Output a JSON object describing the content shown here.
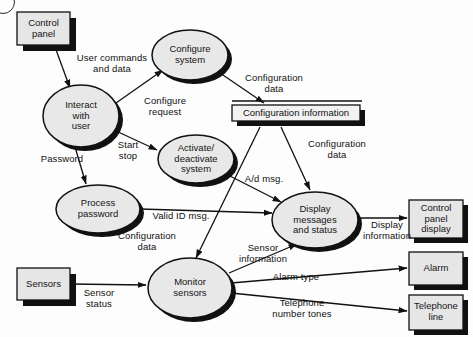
{
  "diagram": {
    "type": "data-flow-diagram",
    "background_color": "#fdfdfd",
    "process_fill": "#e8e8e8",
    "entity_fill": "#e6e6e6",
    "store_fill": "#f2f2f2",
    "stroke_color": "#111111",
    "shadow_color": "#111111"
  },
  "processes": [
    {
      "id": "interact-with-user",
      "label": "Interact\nwith\nuser",
      "cx": 81,
      "cy": 116,
      "rx": 38,
      "ry": 31
    },
    {
      "id": "configure-system",
      "label": "Configure\nsystem",
      "cx": 190,
      "cy": 55,
      "rx": 38,
      "ry": 25
    },
    {
      "id": "activate-deactivate-system",
      "label": "Activate/\ndeactivate\nsystem",
      "cx": 196,
      "cy": 159,
      "rx": 38,
      "ry": 24
    },
    {
      "id": "process-password",
      "label": "Process\npassword",
      "cx": 98,
      "cy": 209,
      "rx": 42,
      "ry": 24
    },
    {
      "id": "display-messages-and-status",
      "label": "Display\nmessages\nand status",
      "cx": 315,
      "cy": 220,
      "rx": 43,
      "ry": 28
    },
    {
      "id": "monitor-sensors",
      "label": "Monitor\nsensors",
      "cx": 190,
      "cy": 288,
      "rx": 42,
      "ry": 30
    }
  ],
  "entities": [
    {
      "id": "control-panel",
      "label": "Control\npanel",
      "x": 17,
      "y": 12,
      "w": 53,
      "h": 33
    },
    {
      "id": "sensors",
      "label": "Sensors",
      "x": 17,
      "y": 268,
      "w": 53,
      "h": 32
    },
    {
      "id": "control-panel-display",
      "label": "Control\npanel\ndisplay",
      "x": 409,
      "y": 200,
      "w": 54,
      "h": 38
    },
    {
      "id": "alarm",
      "label": "Alarm",
      "x": 409,
      "y": 252,
      "w": 54,
      "h": 33
    },
    {
      "id": "telephone-line",
      "label": "Telephone\nline",
      "x": 409,
      "y": 295,
      "w": 54,
      "h": 35
    }
  ],
  "stores": [
    {
      "id": "configuration-information",
      "label": "Configuration information",
      "x": 232,
      "y": 105,
      "w": 128,
      "h": 16
    }
  ],
  "flows": [
    {
      "id": "user-commands-and-data",
      "label": "User commands\nand data",
      "label_x": 68,
      "label_y": 53
    },
    {
      "id": "configure-request",
      "label": "Configure\nrequest",
      "label_x": 134,
      "label_y": 96
    },
    {
      "id": "configuration-data-store-in",
      "label": "Configuration\ndata",
      "label_x": 237,
      "label_y": 73
    },
    {
      "id": "password",
      "label": "Password",
      "label_x": 34,
      "label_y": 154
    },
    {
      "id": "start-stop",
      "label": "Start\nstop",
      "label_x": 123,
      "label_y": 140
    },
    {
      "id": "ad-msg",
      "label": "A/d msg.",
      "label_x": 247,
      "label_y": 177
    },
    {
      "id": "configuration-data-to-display",
      "label": "Configuration\ndata",
      "label_x": 300,
      "label_y": 139
    },
    {
      "id": "valid-id-msg",
      "label": "Valid ID msg.",
      "label_x": 154,
      "label_y": 216
    },
    {
      "id": "configuration-data-to-monitor",
      "label": "Configuration\ndata",
      "label_x": 140,
      "label_y": 233
    },
    {
      "id": "sensor-status",
      "label": "Sensor\nstatus",
      "label_x": 92,
      "label_y": 290
    },
    {
      "id": "sensor-information",
      "label": "Sensor\ninformation",
      "label_x": 247,
      "label_y": 245
    },
    {
      "id": "display-information",
      "label": "Display\ninformation",
      "label_x": 364,
      "label_y": 222
    },
    {
      "id": "alarm-type",
      "label": "Alarm type",
      "label_x": 287,
      "label_y": 277
    },
    {
      "id": "telephone-number-tones",
      "label": "Telephone\nnumber tones",
      "label_x": 287,
      "label_y": 302
    }
  ]
}
